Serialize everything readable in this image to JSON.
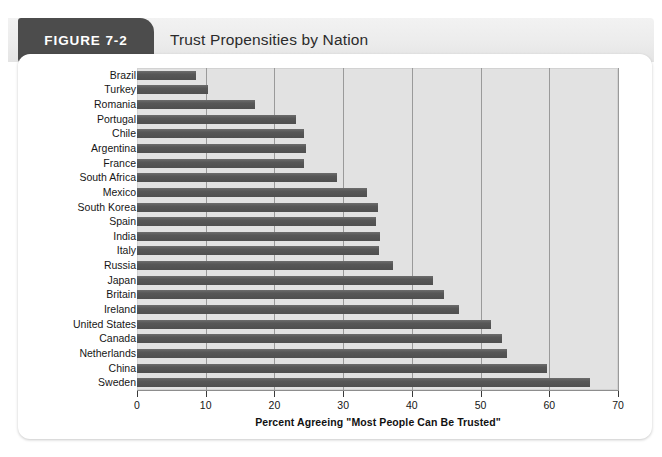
{
  "figure": {
    "tag": "FIGURE 7-2",
    "title": "Trust Propensities by Nation"
  },
  "chart_data": {
    "type": "bar",
    "orientation": "horizontal",
    "title": "Trust Propensities by Nation",
    "xlabel": "Percent Agreeing \"Most People Can Be Trusted\"",
    "ylabel": "",
    "xlim": [
      0,
      70
    ],
    "xticks": [
      0,
      10,
      20,
      30,
      40,
      50,
      60,
      70
    ],
    "grid": "vertical",
    "legend": "none",
    "bar_color": "#555555",
    "plot_background": "#e2e2e2",
    "categories": [
      "Brazil",
      "Turkey",
      "Romania",
      "Portugal",
      "Chile",
      "Argentina",
      "France",
      "South Africa",
      "Mexico",
      "South Korea",
      "Spain",
      "India",
      "Italy",
      "Russia",
      "Japan",
      "Britain",
      "Ireland",
      "United States",
      "Canada",
      "Netherlands",
      "China",
      "Sweden"
    ],
    "values": [
      8.6,
      10.3,
      17.2,
      23.1,
      24.3,
      24.6,
      24.3,
      29.1,
      33.5,
      35.1,
      34.8,
      35.4,
      35.2,
      37.2,
      43.1,
      44.7,
      46.9,
      51.5,
      53.1,
      53.9,
      59.7,
      65.9
    ]
  }
}
